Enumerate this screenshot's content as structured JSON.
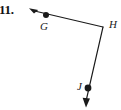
{
  "figure": {
    "problem_number": "11.",
    "background_color": "#ffffff",
    "stroke_color": "#1a1a1a",
    "width": 121,
    "height": 110,
    "type": "angle-diagram",
    "vertices": [
      {
        "name": "G",
        "label": "G",
        "x": 46,
        "y": 15,
        "has_dot": true,
        "label_x": 40,
        "label_y": 21
      },
      {
        "name": "H",
        "label": "H",
        "x": 103,
        "y": 27,
        "has_dot": false,
        "label_x": 109,
        "label_y": 19
      },
      {
        "name": "J",
        "label": "J",
        "x": 88,
        "y": 88,
        "has_dot": true,
        "label_x": 77,
        "label_y": 81
      }
    ],
    "arrowheads": [
      {
        "name": "arrowhead-ray-HG",
        "tip_x": 29,
        "tip_y": 9,
        "direction": "up-left"
      },
      {
        "name": "arrowhead-ray-HJ",
        "tip_x": 86,
        "tip_y": 107,
        "direction": "down"
      }
    ],
    "path": "M 29 9 L 46 15 L 103 27 L 88 88 L 86 104",
    "segments": [
      {
        "name": "ray-H-to-G",
        "from": "H",
        "to": "arrowhead-ray-HG"
      },
      {
        "name": "ray-H-to-J",
        "from": "H",
        "to": "arrowhead-ray-HJ"
      }
    ]
  }
}
